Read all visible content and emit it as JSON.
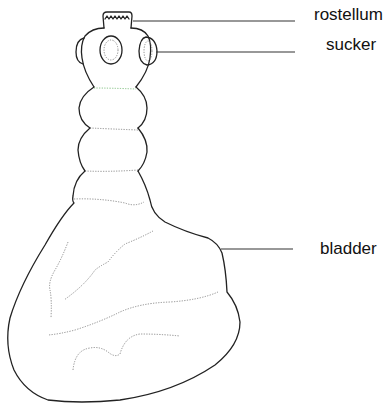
{
  "figure": {
    "type": "biological-diagram",
    "labels": [
      {
        "id": "rostellum",
        "text": "rostellum"
      },
      {
        "id": "sucker",
        "text": "sucker"
      },
      {
        "id": "bladder",
        "text": "bladder"
      }
    ],
    "colors": {
      "outline": "#222222",
      "internal_lines": "#8a8a8a",
      "background": "#ffffff"
    }
  }
}
